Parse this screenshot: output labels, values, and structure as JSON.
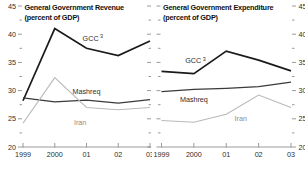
{
  "figure": {
    "background": "#ffffff",
    "axis_color": "#8f8f8f",
    "tick_label_color": "#2d2d2d",
    "title_color": "#111111"
  },
  "chart_data": [
    {
      "type": "line",
      "panel": "revenue",
      "title": "General Government Revenue",
      "subtitle": "(percent of GDP)",
      "x_tick_labels": [
        "1999",
        "2000",
        "01",
        "02",
        "03"
      ],
      "ylim": [
        20,
        45
      ],
      "y_major_ticks": [
        20,
        25,
        30,
        35,
        40,
        45
      ],
      "y_minor_ticks": [
        22.5,
        27.5,
        32.5,
        37.5,
        42.5
      ],
      "y_label_side": "left",
      "grid": false,
      "legend": "inline-labels",
      "series": [
        {
          "name": "GCC",
          "label": "GCC",
          "label_superscript": "3",
          "values": [
            28.2,
            41.0,
            37.5,
            36.2,
            38.8
          ],
          "color": "#1b1b1b",
          "stroke_width": 1.7,
          "label_color": "#2d2d2d",
          "label_pos": {
            "x": 2.2,
            "y": 39.3
          }
        },
        {
          "name": "Mashreq",
          "label": "Mashreq",
          "values": [
            28.7,
            28.0,
            28.3,
            27.8,
            28.4
          ],
          "color": "#3a3a3a",
          "stroke_width": 1.25,
          "label_color": "#2d2d2d",
          "label_pos": {
            "x": 2.0,
            "y": 29.9
          }
        },
        {
          "name": "Iran",
          "label": "Iran",
          "values": [
            24.2,
            32.3,
            27.0,
            26.6,
            27.0
          ],
          "color": "#b9b9b9",
          "stroke_width": 1.1,
          "label_color": "#8d8d8d",
          "label_pos": {
            "x": 1.8,
            "y": 24.4
          }
        }
      ]
    },
    {
      "type": "line",
      "panel": "expenditure",
      "title": "General Government Expenditure",
      "subtitle": "(percent of GDP)",
      "x_tick_labels": [
        "1999",
        "2000",
        "01",
        "02",
        "03"
      ],
      "ylim": [
        20,
        45
      ],
      "y_major_ticks": [
        20,
        25,
        30,
        35,
        40,
        45
      ],
      "y_minor_ticks": [
        22.5,
        27.5,
        32.5,
        37.5,
        42.5
      ],
      "y_label_side": "right",
      "grid": false,
      "legend": "inline-labels",
      "series": [
        {
          "name": "GCC",
          "label": "GCC",
          "label_superscript": "3",
          "values": [
            33.4,
            33.0,
            37.0,
            35.4,
            33.5
          ],
          "color": "#1b1b1b",
          "stroke_width": 1.7,
          "label_color": "#2d2d2d",
          "label_pos": {
            "x": 1.05,
            "y": 35.3
          }
        },
        {
          "name": "Mashreq",
          "label": "Mashreq",
          "values": [
            29.8,
            30.2,
            30.4,
            30.7,
            31.5
          ],
          "color": "#3a3a3a",
          "stroke_width": 1.25,
          "label_color": "#2d2d2d",
          "label_pos": {
            "x": 1.0,
            "y": 28.4
          }
        },
        {
          "name": "Iran",
          "label": "Iran",
          "values": [
            24.7,
            24.4,
            25.8,
            29.2,
            27.0
          ],
          "color": "#b9b9b9",
          "stroke_width": 1.1,
          "label_color": "#8d8d8d",
          "label_pos": {
            "x": 2.45,
            "y": 25.0
          }
        }
      ]
    }
  ]
}
